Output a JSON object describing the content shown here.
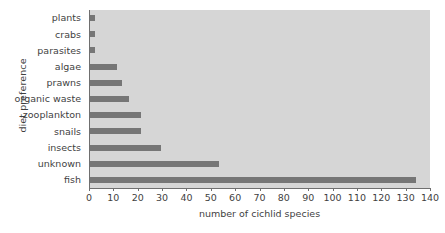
{
  "chart_data": {
    "type": "bar",
    "orientation": "horizontal",
    "title": "",
    "xlabel": "number of cichlid species",
    "ylabel": "diet preference",
    "categories": [
      "plants",
      "crabs",
      "parasites",
      "algae",
      "prawns",
      "organic waste",
      "zooplankton",
      "snails",
      "insects",
      "unknown",
      "fish"
    ],
    "values": [
      2,
      2,
      2,
      11,
      13,
      16,
      21,
      21,
      29,
      53,
      134
    ],
    "xlim": [
      0,
      140
    ],
    "xticks": [
      0,
      10,
      20,
      30,
      40,
      50,
      60,
      70,
      80,
      90,
      100,
      110,
      120,
      130,
      140
    ],
    "xtick_labels": [
      "0",
      "10",
      "20",
      "30",
      "40",
      "50",
      "60",
      "70",
      "80",
      "90",
      "100",
      "110",
      "120",
      "130",
      "140"
    ],
    "grid": false,
    "legend": null,
    "plot_background_color": "#d6d6d6",
    "bar_color": "#767676",
    "axis_color": "#6f6f6f",
    "text_color": "#3f3f3f"
  }
}
